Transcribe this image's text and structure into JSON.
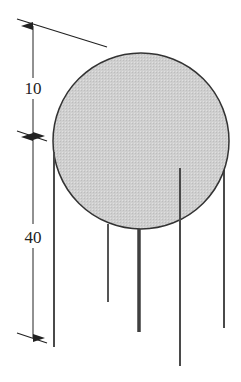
{
  "diagram": {
    "type": "spherical-tank-on-legs",
    "dimensions": [
      {
        "id": "top",
        "label": "10"
      },
      {
        "id": "bottom",
        "label": "40"
      }
    ],
    "colors": {
      "sphere_fill": "#c9c9c9",
      "outline": "#333333",
      "legs": "#4a4a4a"
    }
  }
}
